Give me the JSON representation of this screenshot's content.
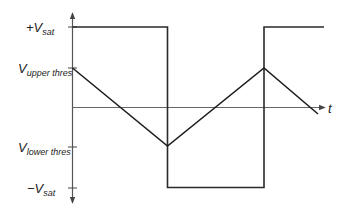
{
  "diagram": {
    "title": "",
    "colors": {
      "waveform": "#1e1e1e",
      "axis": "#555555",
      "background": "#ffffff"
    },
    "axes": {
      "vertical": {
        "label": "",
        "direction": "both arrows"
      },
      "horizontal": {
        "label": "t"
      }
    },
    "labels": {
      "plus_vsat": {
        "prefix": "+V",
        "sub": "sat"
      },
      "upper_thres": {
        "prefix": "V",
        "sub": "upper thres"
      },
      "lower_thres": {
        "prefix": "V",
        "sub": "lower thres"
      },
      "minus_vsat": {
        "prefix": "−V",
        "sub": "sat"
      },
      "time": "t"
    },
    "waveforms": [
      {
        "name": "square-wave",
        "description": "Output square wave switching between +Vsat and -Vsat"
      },
      {
        "name": "triangle-wave",
        "description": "Triangle wave ramping between Vupper thres and Vlower thres"
      }
    ]
  }
}
